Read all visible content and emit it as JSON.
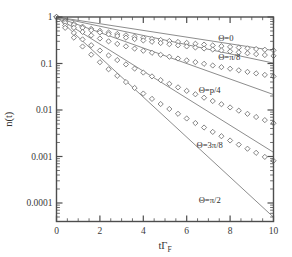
{
  "chart_data": {
    "type": "line",
    "title": "",
    "xlabel": "tΓ_F",
    "xlabel_main": "tΓ",
    "xlabel_sub": "F",
    "ylabel": "n(t)",
    "yscale": "log",
    "xscale": "linear",
    "xlim": [
      0,
      10
    ],
    "ylim": [
      4e-05,
      1
    ],
    "grid": false,
    "legend_position": "inline-right",
    "xticks": [
      0,
      2,
      4,
      6,
      8,
      10
    ],
    "xticklabels": [
      "0",
      "2",
      "4",
      "6",
      "8",
      "10"
    ],
    "yticks": [
      1,
      0.1,
      0.01,
      0.001,
      0.0001
    ],
    "yticklabels": [
      "1",
      "0.1",
      "0.01",
      "0.001",
      "0.0001"
    ],
    "series": [
      {
        "name": "Θ=0",
        "label": "Θ=0",
        "label_x": 7.45,
        "label_y": 0.36,
        "marker": "diamond",
        "x": [
          0,
          0.4,
          0.8,
          1.2,
          1.6,
          2.0,
          2.4,
          2.8,
          3.2,
          3.6,
          4.0,
          4.4,
          4.8,
          5.2,
          5.6,
          6.0,
          6.4,
          6.8,
          7.2,
          7.6,
          8.0,
          8.4,
          8.8,
          9.2,
          9.6,
          10.0
        ],
        "y": [
          1.0,
          0.83,
          0.71,
          0.62,
          0.555,
          0.505,
          0.465,
          0.432,
          0.404,
          0.379,
          0.357,
          0.338,
          0.321,
          0.305,
          0.291,
          0.278,
          0.266,
          0.255,
          0.245,
          0.236,
          0.228,
          0.22,
          0.212,
          0.205,
          0.198,
          0.192
        ]
      },
      {
        "name": "Θ=π/8",
        "label": "Θ=π/8",
        "label_x": 7.45,
        "label_y": 0.135,
        "marker": "diamond",
        "x": [
          0,
          0.4,
          0.8,
          1.2,
          1.6,
          2.0,
          2.4,
          2.8,
          3.2,
          3.6,
          4.0,
          4.4,
          4.8,
          5.2,
          5.6,
          6.0,
          6.4,
          6.8,
          7.2,
          7.6,
          8.0,
          8.4,
          8.8,
          9.2,
          9.6,
          10.0
        ],
        "y": [
          1.0,
          0.8,
          0.675,
          0.585,
          0.518,
          0.466,
          0.424,
          0.39,
          0.36,
          0.335,
          0.313,
          0.293,
          0.276,
          0.26,
          0.246,
          0.233,
          0.221,
          0.21,
          0.2,
          0.191,
          0.182,
          0.174,
          0.166,
          0.159,
          0.152,
          0.146
        ]
      },
      {
        "name": "Θ=p/4",
        "label": "Θ=p/4",
        "label_x": 6.55,
        "label_y": 0.0275,
        "marker": "diamond",
        "x": [
          0,
          0.4,
          0.8,
          1.2,
          1.6,
          2.0,
          2.4,
          2.8,
          3.2,
          3.6,
          4.0,
          4.4,
          4.8,
          5.2,
          5.6,
          6.0,
          6.4,
          6.8,
          7.2,
          7.6,
          8.0,
          8.4,
          8.8,
          9.2,
          9.6,
          10.0
        ],
        "y": [
          1.0,
          0.745,
          0.585,
          0.478,
          0.402,
          0.345,
          0.3,
          0.264,
          0.234,
          0.209,
          0.188,
          0.17,
          0.154,
          0.14,
          0.128,
          0.117,
          0.107,
          0.0985,
          0.0905,
          0.0835,
          0.0772,
          0.0714,
          0.0661,
          0.0613,
          0.0569,
          0.0528
        ]
      },
      {
        "name": "Θ=3π/8",
        "label": "Θ=3π/8",
        "label_x": 6.45,
        "label_y": 0.00175,
        "marker": "diamond",
        "x": [
          0,
          0.4,
          0.8,
          1.2,
          1.6,
          2.0,
          2.4,
          2.8,
          3.2,
          3.6,
          4.0,
          4.4,
          4.8,
          5.2,
          5.6,
          6.0,
          6.4,
          6.8,
          7.2,
          7.6,
          8.0,
          8.4,
          8.8,
          9.2,
          9.6,
          10.0
        ],
        "y": [
          1.0,
          0.655,
          0.455,
          0.33,
          0.247,
          0.19,
          0.149,
          0.1185,
          0.0955,
          0.0778,
          0.0639,
          0.0528,
          0.0439,
          0.0366,
          0.0307,
          0.0258,
          0.0218,
          0.0184,
          0.0156,
          0.0133,
          0.01135,
          0.00968,
          0.00827,
          0.00707,
          0.00606,
          0.0052
        ]
      },
      {
        "name": "Θ=π/2",
        "label": "Θ=π/2",
        "label_x": 6.55,
        "label_y": 0.000115,
        "marker": "diamond",
        "x": [
          0,
          0.4,
          0.8,
          1.2,
          1.6,
          2.0,
          2.4,
          2.8,
          3.2,
          3.6,
          4.0,
          4.4,
          4.8,
          5.2,
          5.6,
          6.0,
          6.4,
          6.8,
          7.2,
          7.6,
          8.0,
          8.4,
          8.8,
          9.2,
          9.6,
          10.0
        ],
        "y": [
          1.0,
          0.585,
          0.36,
          0.232,
          0.155,
          0.1065,
          0.0752,
          0.0543,
          0.0399,
          0.0298,
          0.0226,
          0.01735,
          0.01345,
          0.01052,
          0.00829,
          0.00657,
          0.00524,
          0.0042,
          0.00338,
          0.00273,
          0.00221,
          0.0018,
          0.00147,
          0.0012,
          0.00098,
          0.00081
        ]
      }
    ],
    "fit_lines": [
      {
        "name": "fit-theta-0",
        "x0": 0,
        "y0": 1.0,
        "x1": 10,
        "y1": 0.19
      },
      {
        "name": "fit-theta-pi-8",
        "x0": 0,
        "y0": 1.0,
        "x1": 10,
        "y1": 0.102
      },
      {
        "name": "fit-theta-p-4",
        "x0": 0,
        "y0": 1.0,
        "x1": 10,
        "y1": 0.0215
      },
      {
        "name": "fit-theta-3pi-8",
        "x0": 0,
        "y0": 1.0,
        "x1": 10,
        "y1": 0.00123
      },
      {
        "name": "fit-theta-pi-2",
        "x0": 0,
        "y0": 1.0,
        "x1": 10,
        "y1": 4.95e-05
      }
    ],
    "colors": {
      "axis": "#4d4d4d",
      "marker_edge": "#6f6f6f",
      "marker_fill": "#ffffff",
      "fit_line": "#8d8d8d",
      "text": "#333333",
      "background": "#ffffff"
    }
  }
}
